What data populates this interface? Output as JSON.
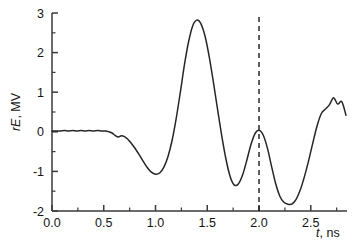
{
  "chart_data": {
    "type": "line",
    "title": "",
    "xlabel": "t, ns",
    "ylabel": "rE, MV",
    "xlabel_italic": "t",
    "xlabel_rest": ", ns",
    "ylabel_italic_prefix": "r",
    "ylabel_italic": "E",
    "ylabel_rest": ", MV",
    "xlim": [
      0.0,
      2.85
    ],
    "ylim": [
      -2,
      3
    ],
    "grid": false,
    "legend": false,
    "x_ticks": [
      0.0,
      0.5,
      1.0,
      1.5,
      2.0,
      2.5
    ],
    "x_tick_labels": [
      "0.0",
      "0.5",
      "1.0",
      "1.5",
      "2.0",
      "2.5"
    ],
    "x_minor_step": 0.25,
    "y_ticks": [
      -2,
      -1,
      0,
      1,
      2,
      3
    ],
    "y_tick_labels": [
      "-2",
      "-1",
      "0",
      "1",
      "2",
      "3"
    ],
    "y_minor_step": 0.5,
    "annotations": [
      {
        "name": "vertical-dashed-marker",
        "type": "vline",
        "x": 2.0,
        "y_from": -2.0,
        "y_to": 2.95,
        "style": "dashed"
      }
    ],
    "series": [
      {
        "name": "rE field trace",
        "color": "#262626",
        "x": [
          0.0,
          0.04,
          0.08,
          0.12,
          0.16,
          0.2,
          0.24,
          0.28,
          0.32,
          0.36,
          0.4,
          0.44,
          0.48,
          0.52,
          0.55,
          0.58,
          0.61,
          0.64,
          0.67,
          0.7,
          0.73,
          0.76,
          0.8,
          0.84,
          0.88,
          0.92,
          0.96,
          1.0,
          1.04,
          1.08,
          1.12,
          1.16,
          1.2,
          1.24,
          1.28,
          1.32,
          1.36,
          1.4,
          1.44,
          1.48,
          1.52,
          1.56,
          1.6,
          1.64,
          1.68,
          1.72,
          1.76,
          1.8,
          1.84,
          1.88,
          1.92,
          1.96,
          2.0,
          2.04,
          2.08,
          2.12,
          2.16,
          2.2,
          2.24,
          2.28,
          2.32,
          2.36,
          2.4,
          2.44,
          2.48,
          2.52,
          2.56,
          2.6,
          2.64,
          2.68,
          2.72,
          2.76,
          2.8,
          2.84
        ],
        "y": [
          0.02,
          0.02,
          0.02,
          0.03,
          0.02,
          0.03,
          0.02,
          0.03,
          0.02,
          0.03,
          0.02,
          0.03,
          0.02,
          0.02,
          0.0,
          -0.03,
          -0.09,
          -0.13,
          -0.1,
          -0.12,
          -0.18,
          -0.27,
          -0.41,
          -0.57,
          -0.74,
          -0.9,
          -1.02,
          -1.07,
          -1.04,
          -0.9,
          -0.63,
          -0.22,
          0.34,
          1.0,
          1.7,
          2.28,
          2.68,
          2.82,
          2.72,
          2.4,
          1.88,
          1.24,
          0.56,
          -0.1,
          -0.68,
          -1.12,
          -1.34,
          -1.32,
          -1.1,
          -0.74,
          -0.34,
          -0.05,
          0.04,
          -0.08,
          -0.4,
          -0.86,
          -1.3,
          -1.62,
          -1.78,
          -1.83,
          -1.82,
          -1.7,
          -1.46,
          -1.12,
          -0.72,
          -0.28,
          0.14,
          0.45,
          0.57,
          0.68,
          0.86,
          0.7,
          0.76,
          0.42
        ]
      }
    ]
  },
  "figure": {
    "background_color": "#ffffff",
    "axis_color": "#3a3a3a",
    "curve_color": "#262626",
    "marker_color": "#1a1a1a"
  }
}
